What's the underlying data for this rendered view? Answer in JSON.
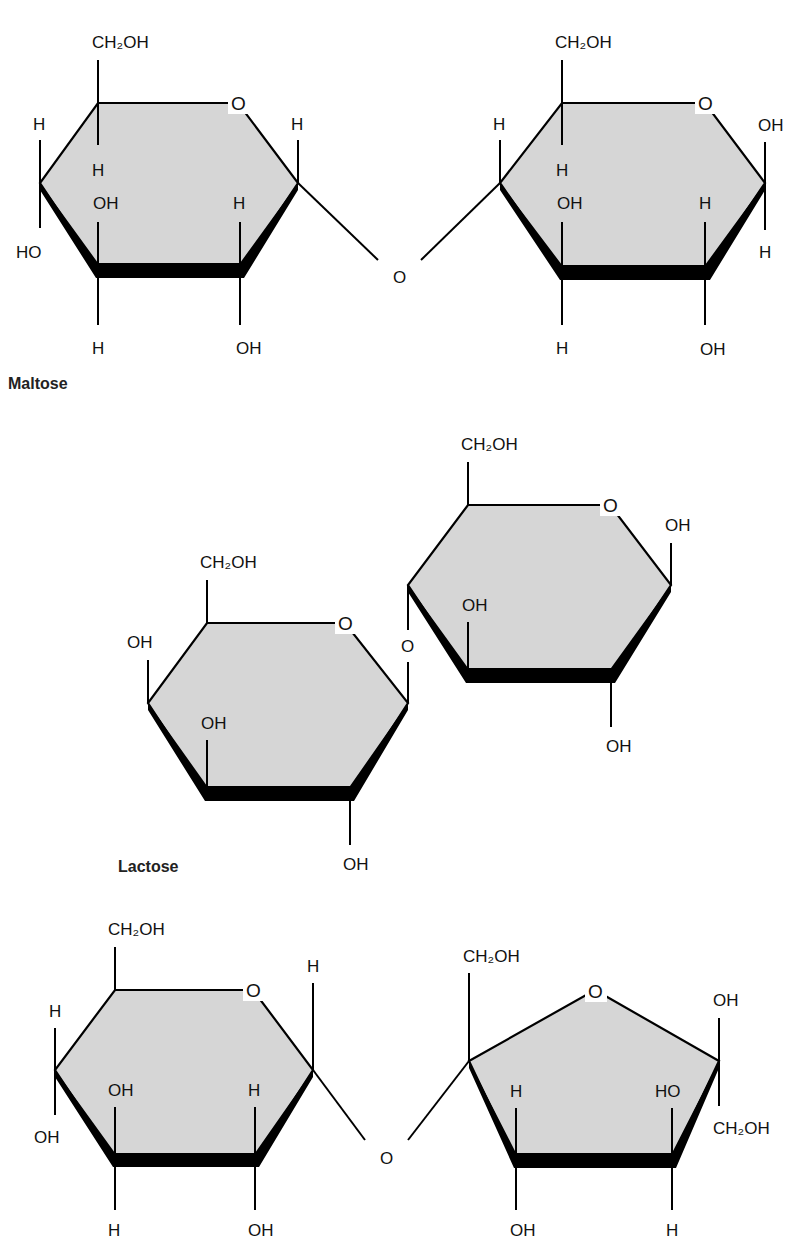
{
  "figure": {
    "colors": {
      "ring_fill": "#d6d6d6",
      "stroke": "#000000",
      "text": "#111111"
    }
  },
  "maltose": {
    "name": "Maltose",
    "left_ring": {
      "ring_oxygen": "O",
      "c6_group": "CH₂OH",
      "c5_h": "H",
      "c4_up": "H",
      "c4_down": "HO",
      "c3_up": "OH",
      "c3_down": "H",
      "c2_up": "H",
      "c2_down": "OH",
      "c1_up": "H"
    },
    "glycosidic_oxygen": "O",
    "right_ring": {
      "ring_oxygen": "O",
      "c6_group": "CH₂OH",
      "c5_h": "H",
      "c4_up": "H",
      "c3_up": "OH",
      "c3_down": "H",
      "c2_up": "H",
      "c2_down": "OH",
      "c1_up": "OH",
      "c1_down": "H"
    }
  },
  "lactose": {
    "name": "Lactose",
    "left_ring": {
      "ring_oxygen": "O",
      "c6_group": "CH₂OH",
      "c4_up": "OH",
      "c3_up": "OH",
      "c2_down": "OH"
    },
    "glycosidic_oxygen": "O",
    "right_ring": {
      "ring_oxygen": "O",
      "c6_group": "CH₂OH",
      "c3_up": "OH",
      "c2_down": "OH",
      "c1_up": "OH"
    }
  },
  "sucrose": {
    "glucose_ring": {
      "ring_oxygen": "O",
      "c6_group": "CH₂OH",
      "c4_up": "H",
      "c4_down": "OH",
      "c3_up": "OH",
      "c3_down": "H",
      "c2_up": "H",
      "c2_down": "OH",
      "c1_up": "H"
    },
    "glycosidic_oxygen": "O",
    "fructose_ring": {
      "ring_oxygen": "O",
      "c2_group": "CH₂OH",
      "c3_up": "H",
      "c3_down": "OH",
      "c4_up": "HO",
      "c4_down": "H",
      "c5_up": "OH",
      "c5_down": "CH₂OH"
    }
  }
}
